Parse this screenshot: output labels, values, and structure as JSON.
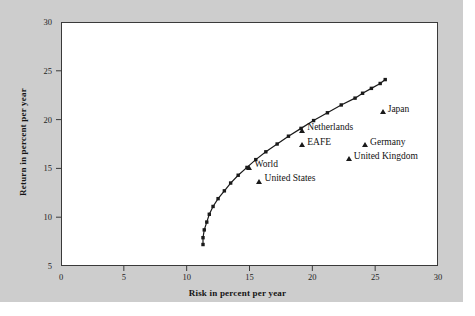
{
  "figure": {
    "background_color": "#cdcdcd",
    "plot_background_color": "#ffffff",
    "frame_color": "#3a3a3a"
  },
  "chart_data": {
    "type": "scatter",
    "title": "",
    "xlabel": "Risk in percent per year",
    "ylabel": "Return in percent per year",
    "xlim": [
      0,
      30
    ],
    "ylim": [
      5,
      30
    ],
    "xticks": [
      0,
      5,
      10,
      15,
      20,
      25,
      30
    ],
    "yticks": [
      5,
      10,
      15,
      20,
      25,
      30
    ],
    "grid": false,
    "legend": "none",
    "series": [
      {
        "name": "Efficient frontier",
        "type": "line",
        "marker": "filled-square",
        "color": "#1a1a1a",
        "points": [
          {
            "x": 11.3,
            "y": 7.2
          },
          {
            "x": 11.3,
            "y": 7.9
          },
          {
            "x": 11.4,
            "y": 8.7
          },
          {
            "x": 11.6,
            "y": 9.5
          },
          {
            "x": 11.8,
            "y": 10.3
          },
          {
            "x": 12.1,
            "y": 11.1
          },
          {
            "x": 12.5,
            "y": 11.9
          },
          {
            "x": 13.0,
            "y": 12.7
          },
          {
            "x": 13.5,
            "y": 13.5
          },
          {
            "x": 14.1,
            "y": 14.3
          },
          {
            "x": 14.8,
            "y": 15.1
          },
          {
            "x": 15.5,
            "y": 15.9
          },
          {
            "x": 16.3,
            "y": 16.7
          },
          {
            "x": 17.2,
            "y": 17.5
          },
          {
            "x": 18.1,
            "y": 18.3
          },
          {
            "x": 19.1,
            "y": 19.1
          },
          {
            "x": 20.1,
            "y": 19.9
          },
          {
            "x": 21.2,
            "y": 20.7
          },
          {
            "x": 22.3,
            "y": 21.5
          },
          {
            "x": 23.4,
            "y": 22.2
          },
          {
            "x": 24.0,
            "y": 22.7
          },
          {
            "x": 24.7,
            "y": 23.2
          },
          {
            "x": 25.4,
            "y": 23.7
          },
          {
            "x": 25.8,
            "y": 24.1
          }
        ]
      },
      {
        "name": "Assets",
        "type": "scatter",
        "marker": "triangle",
        "color": "#1a1a1a",
        "points": [
          {
            "label": "Japan",
            "x": 25.6,
            "y": 20.8,
            "label_pos": "right"
          },
          {
            "label": "Netherlands",
            "x": 19.2,
            "y": 18.9,
            "label_pos": "right"
          },
          {
            "label": "EAFE",
            "x": 19.2,
            "y": 17.4,
            "label_pos": "right"
          },
          {
            "label": "Germany",
            "x": 24.2,
            "y": 17.4,
            "label_pos": "right"
          },
          {
            "label": "United Kingdom",
            "x": 22.9,
            "y": 16.0,
            "label_pos": "right"
          },
          {
            "label": "World",
            "x": 15.0,
            "y": 15.1,
            "label_pos": "right"
          },
          {
            "label": "United States",
            "x": 15.8,
            "y": 13.7,
            "label_pos": "right"
          }
        ]
      }
    ]
  }
}
